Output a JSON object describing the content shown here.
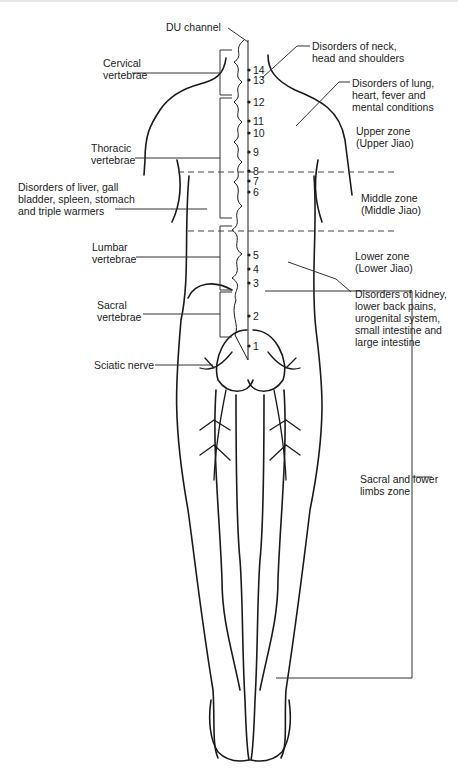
{
  "figure": {
    "colors": {
      "line": "#1a1a1a",
      "leader": "#333333",
      "background": "#ffffff"
    }
  },
  "labels_left": {
    "du_channel": "DU channel",
    "cervical": "Cervical\nvertebrae",
    "thoracic": "Thoracic\nvertebrae",
    "liver_disorders": "Disorders of liver, gall\nbladder, spleen, stomach\nand triple warmers",
    "lumbar": "Lumbar\nvertebrae",
    "sacral": "Sacral\nvertebrae",
    "sciatic": "Sciatic nerve"
  },
  "labels_right": {
    "neck_disorders": "Disorders of neck,\nhead and shoulders",
    "lung_disorders": "Disorders of lung,\nheart, fever and\nmental conditions",
    "upper_zone": "Upper zone\n(Upper Jiao)",
    "middle_zone": "Middle zone\n(Middle Jiao)",
    "lower_zone": "Lower zone\n(Lower Jiao)",
    "kidney_disorders": "Disorders of kidney,\nlower back pains,\nurogenital system,\nsmall intestine and\nlarge intestine",
    "sacral_limbs_zone": "Sacral and lower\nlimbs zone"
  },
  "spine_points": [
    {
      "n": "14",
      "y": 70
    },
    {
      "n": "13",
      "y": 80
    },
    {
      "n": "12",
      "y": 102
    },
    {
      "n": "11",
      "y": 121
    },
    {
      "n": "10",
      "y": 133
    },
    {
      "n": "9",
      "y": 152
    },
    {
      "n": "8",
      "y": 171
    },
    {
      "n": "7",
      "y": 181
    },
    {
      "n": "6",
      "y": 192
    },
    {
      "n": "5",
      "y": 255
    },
    {
      "n": "4",
      "y": 269
    },
    {
      "n": "3",
      "y": 283
    },
    {
      "n": "2",
      "y": 316
    },
    {
      "n": "1",
      "y": 346
    }
  ]
}
